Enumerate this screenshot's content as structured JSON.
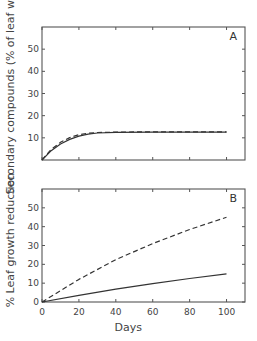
{
  "chart_data": [
    {
      "type": "line",
      "panel": "A",
      "title": "",
      "panel_label": "A",
      "xlabel": "",
      "ylabel": "Secondary compounds (% of leaf wt)",
      "xlim": [
        0,
        110
      ],
      "ylim": [
        0,
        60
      ],
      "yticks": [
        "10",
        "20",
        "30",
        "40",
        "50"
      ],
      "ytick_values": [
        10,
        20,
        30,
        40,
        50
      ],
      "xtick_values": [
        0,
        20,
        40,
        60,
        80,
        100
      ],
      "grid": false,
      "series": [
        {
          "name": "solid",
          "style": "solid",
          "x": [
            0,
            5,
            10,
            15,
            20,
            25,
            30,
            40,
            60,
            80,
            100
          ],
          "y": [
            0,
            4.2,
            7.2,
            9.3,
            10.8,
            11.7,
            12.2,
            12.5,
            12.6,
            12.6,
            12.6
          ]
        },
        {
          "name": "dashed",
          "style": "dashed",
          "x": [
            0,
            5,
            10,
            15,
            20,
            25,
            30,
            40,
            60,
            80,
            100
          ],
          "y": [
            0,
            4.8,
            8.0,
            10.1,
            11.4,
            12.1,
            12.4,
            12.6,
            12.7,
            12.7,
            12.7
          ]
        }
      ]
    },
    {
      "type": "line",
      "panel": "B",
      "title": "",
      "panel_label": "B",
      "xlabel": "Days",
      "ylabel": "% Leaf growth reduction",
      "xlim": [
        0,
        110
      ],
      "ylim": [
        0,
        60
      ],
      "xticks": [
        "0",
        "20",
        "40",
        "60",
        "80",
        "100"
      ],
      "xtick_values": [
        0,
        20,
        40,
        60,
        80,
        100
      ],
      "yticks": [
        "0",
        "10",
        "20",
        "30",
        "40",
        "50"
      ],
      "ytick_values": [
        0,
        10,
        20,
        30,
        40,
        50
      ],
      "grid": false,
      "series": [
        {
          "name": "dashed",
          "style": "dashed",
          "x": [
            0,
            20,
            40,
            60,
            80,
            100
          ],
          "y": [
            0,
            12,
            22.5,
            31,
            38.5,
            45
          ]
        },
        {
          "name": "solid",
          "style": "solid",
          "x": [
            0,
            20,
            40,
            60,
            80,
            100
          ],
          "y": [
            0,
            3.5,
            6.8,
            9.7,
            12.5,
            15
          ]
        }
      ]
    }
  ]
}
